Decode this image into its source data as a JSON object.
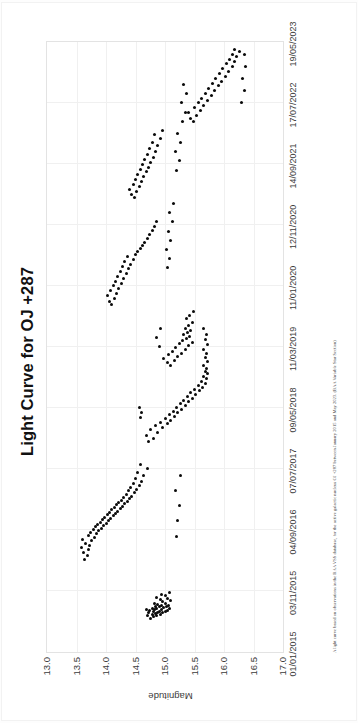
{
  "document": {
    "figure_title": "Light Curve for OJ +287",
    "caption": "A light curve based on observations in the BAA VSS database, for the active galactic nucleus OJ +287 between January 2015 and May 2023. (BAA Variable Star Section)"
  },
  "chart_data": {
    "type": "scatter",
    "title": "Light Curve for OJ +287",
    "xlabel": "",
    "ylabel": "Magnitude",
    "grid": true,
    "legend": "none",
    "y_inverted": true,
    "ylim": [
      13.0,
      17.0
    ],
    "y_ticks": [
      "13.0",
      "13.5",
      "14.0",
      "14.5",
      "15.0",
      "15.5",
      "16.0",
      "16.5",
      "17.0"
    ],
    "x_ticks": [
      "01/01/2015",
      "03/11/2015",
      "04/09/2016",
      "07/07/2017",
      "09/05/2018",
      "11/03/2019",
      "11/01/2020",
      "12/11/2020",
      "14/09/2021",
      "17/07/2022",
      "19/05/2023"
    ],
    "xlim": [
      "01/01/2015",
      "19/05/2023"
    ],
    "series": [
      {
        "name": "OJ +287 visual magnitude",
        "marker": "filled-circle",
        "color": "#0a0a0a",
        "points": [
          [
            0.055,
            14.76
          ],
          [
            0.058,
            14.8
          ],
          [
            0.06,
            14.86
          ],
          [
            0.06,
            14.7
          ],
          [
            0.062,
            14.92
          ],
          [
            0.062,
            14.78
          ],
          [
            0.063,
            14.84
          ],
          [
            0.064,
            14.96
          ],
          [
            0.064,
            14.72
          ],
          [
            0.065,
            14.88
          ],
          [
            0.066,
            15.0
          ],
          [
            0.066,
            14.8
          ],
          [
            0.067,
            14.9
          ],
          [
            0.068,
            14.74
          ],
          [
            0.068,
            15.04
          ],
          [
            0.069,
            14.82
          ],
          [
            0.07,
            14.94
          ],
          [
            0.07,
            14.68
          ],
          [
            0.071,
            14.86
          ],
          [
            0.072,
            15.08
          ],
          [
            0.072,
            14.78
          ],
          [
            0.073,
            14.98
          ],
          [
            0.074,
            14.84
          ],
          [
            0.074,
            15.02
          ],
          [
            0.075,
            14.9
          ],
          [
            0.076,
            14.94
          ],
          [
            0.077,
            15.06
          ],
          [
            0.078,
            14.88
          ],
          [
            0.079,
            15.0
          ],
          [
            0.08,
            14.82
          ],
          [
            0.082,
            14.96
          ],
          [
            0.084,
            15.1
          ],
          [
            0.086,
            14.92
          ],
          [
            0.088,
            15.04
          ],
          [
            0.09,
            14.86
          ],
          [
            0.092,
            15.0
          ],
          [
            0.095,
            14.94
          ],
          [
            0.098,
            15.08
          ],
          [
            0.152,
            13.64
          ],
          [
            0.158,
            13.68
          ],
          [
            0.163,
            13.62
          ],
          [
            0.168,
            13.7
          ],
          [
            0.171,
            13.58
          ],
          [
            0.175,
            13.72
          ],
          [
            0.178,
            13.66
          ],
          [
            0.182,
            13.76
          ],
          [
            0.185,
            13.6
          ],
          [
            0.188,
            13.8
          ],
          [
            0.191,
            13.7
          ],
          [
            0.194,
            13.84
          ],
          [
            0.196,
            13.74
          ],
          [
            0.199,
            13.88
          ],
          [
            0.201,
            13.78
          ],
          [
            0.203,
            13.92
          ],
          [
            0.205,
            13.82
          ],
          [
            0.207,
            13.96
          ],
          [
            0.209,
            13.86
          ],
          [
            0.211,
            14.0
          ],
          [
            0.213,
            13.9
          ],
          [
            0.215,
            14.04
          ],
          [
            0.217,
            13.94
          ],
          [
            0.219,
            14.08
          ],
          [
            0.221,
            13.98
          ],
          [
            0.223,
            14.12
          ],
          [
            0.225,
            14.02
          ],
          [
            0.227,
            14.16
          ],
          [
            0.229,
            14.06
          ],
          [
            0.231,
            14.2
          ],
          [
            0.233,
            14.1
          ],
          [
            0.235,
            14.24
          ],
          [
            0.237,
            14.14
          ],
          [
            0.239,
            14.28
          ],
          [
            0.241,
            14.18
          ],
          [
            0.243,
            14.32
          ],
          [
            0.245,
            14.22
          ],
          [
            0.247,
            14.36
          ],
          [
            0.249,
            14.26
          ],
          [
            0.251,
            14.4
          ],
          [
            0.253,
            14.3
          ],
          [
            0.255,
            14.44
          ],
          [
            0.258,
            14.34
          ],
          [
            0.261,
            14.48
          ],
          [
            0.264,
            14.38
          ],
          [
            0.267,
            14.52
          ],
          [
            0.27,
            14.42
          ],
          [
            0.273,
            14.56
          ],
          [
            0.276,
            14.46
          ],
          [
            0.28,
            14.6
          ],
          [
            0.284,
            14.5
          ],
          [
            0.289,
            14.64
          ],
          [
            0.294,
            14.54
          ],
          [
            0.3,
            14.7
          ],
          [
            0.307,
            14.58
          ],
          [
            0.19,
            15.2
          ],
          [
            0.215,
            15.22
          ],
          [
            0.24,
            15.24
          ],
          [
            0.265,
            15.18
          ],
          [
            0.29,
            15.26
          ],
          [
            0.345,
            14.72
          ],
          [
            0.35,
            14.8
          ],
          [
            0.355,
            14.68
          ],
          [
            0.36,
            14.88
          ],
          [
            0.364,
            14.76
          ],
          [
            0.368,
            14.96
          ],
          [
            0.371,
            14.84
          ],
          [
            0.374,
            15.04
          ],
          [
            0.377,
            14.92
          ],
          [
            0.38,
            15.1
          ],
          [
            0.383,
            15.0
          ],
          [
            0.386,
            15.16
          ],
          [
            0.389,
            15.08
          ],
          [
            0.392,
            15.22
          ],
          [
            0.395,
            15.14
          ],
          [
            0.398,
            15.28
          ],
          [
            0.401,
            15.2
          ],
          [
            0.404,
            15.34
          ],
          [
            0.407,
            15.26
          ],
          [
            0.41,
            15.4
          ],
          [
            0.413,
            15.32
          ],
          [
            0.416,
            15.46
          ],
          [
            0.419,
            15.38
          ],
          [
            0.422,
            15.52
          ],
          [
            0.425,
            15.44
          ],
          [
            0.428,
            15.58
          ],
          [
            0.431,
            15.5
          ],
          [
            0.434,
            15.64
          ],
          [
            0.437,
            15.56
          ],
          [
            0.44,
            15.68
          ],
          [
            0.444,
            15.62
          ],
          [
            0.448,
            15.7
          ],
          [
            0.452,
            15.66
          ],
          [
            0.456,
            15.72
          ],
          [
            0.46,
            15.68
          ],
          [
            0.465,
            15.7
          ],
          [
            0.47,
            15.66
          ],
          [
            0.476,
            15.72
          ],
          [
            0.482,
            15.68
          ],
          [
            0.489,
            15.7
          ],
          [
            0.496,
            15.66
          ],
          [
            0.504,
            15.72
          ],
          [
            0.512,
            15.68
          ],
          [
            0.521,
            15.7
          ],
          [
            0.53,
            15.66
          ],
          [
            0.385,
            14.58
          ],
          [
            0.392,
            14.6
          ],
          [
            0.4,
            14.56
          ],
          [
            0.47,
            15.1
          ],
          [
            0.474,
            15.04
          ],
          [
            0.478,
            15.16
          ],
          [
            0.481,
            14.98
          ],
          [
            0.484,
            15.22
          ],
          [
            0.487,
            15.06
          ],
          [
            0.49,
            15.28
          ],
          [
            0.493,
            15.12
          ],
          [
            0.496,
            15.34
          ],
          [
            0.499,
            15.18
          ],
          [
            0.502,
            15.4
          ],
          [
            0.505,
            15.24
          ],
          [
            0.508,
            15.46
          ],
          [
            0.511,
            15.3
          ],
          [
            0.514,
            15.36
          ],
          [
            0.517,
            15.42
          ],
          [
            0.52,
            15.32
          ],
          [
            0.523,
            15.38
          ],
          [
            0.527,
            15.44
          ],
          [
            0.531,
            15.34
          ],
          [
            0.535,
            15.4
          ],
          [
            0.54,
            15.46
          ],
          [
            0.546,
            15.36
          ],
          [
            0.552,
            15.42
          ],
          [
            0.559,
            15.48
          ],
          [
            0.5,
            14.9
          ],
          [
            0.515,
            14.86
          ],
          [
            0.53,
            14.92
          ],
          [
            0.57,
            14.1
          ],
          [
            0.575,
            14.06
          ],
          [
            0.58,
            14.14
          ],
          [
            0.584,
            14.02
          ],
          [
            0.588,
            14.18
          ],
          [
            0.592,
            14.08
          ],
          [
            0.596,
            14.22
          ],
          [
            0.6,
            14.12
          ],
          [
            0.604,
            14.26
          ],
          [
            0.608,
            14.16
          ],
          [
            0.612,
            14.3
          ],
          [
            0.616,
            14.2
          ],
          [
            0.62,
            14.34
          ],
          [
            0.624,
            14.24
          ],
          [
            0.628,
            14.38
          ],
          [
            0.632,
            14.28
          ],
          [
            0.636,
            14.42
          ],
          [
            0.64,
            14.32
          ],
          [
            0.644,
            14.46
          ],
          [
            0.648,
            14.36
          ],
          [
            0.652,
            14.5
          ],
          [
            0.657,
            14.54
          ],
          [
            0.662,
            14.58
          ],
          [
            0.667,
            14.62
          ],
          [
            0.672,
            14.66
          ],
          [
            0.678,
            14.7
          ],
          [
            0.684,
            14.74
          ],
          [
            0.691,
            14.78
          ],
          [
            0.698,
            14.82
          ],
          [
            0.706,
            14.86
          ],
          [
            0.63,
            15.04
          ],
          [
            0.645,
            15.08
          ],
          [
            0.66,
            15.02
          ],
          [
            0.675,
            15.1
          ],
          [
            0.69,
            15.06
          ],
          [
            0.705,
            15.12
          ],
          [
            0.72,
            15.08
          ],
          [
            0.735,
            15.14
          ],
          [
            0.745,
            14.48
          ],
          [
            0.75,
            14.44
          ],
          [
            0.755,
            14.52
          ],
          [
            0.759,
            14.4
          ],
          [
            0.763,
            14.56
          ],
          [
            0.767,
            14.46
          ],
          [
            0.771,
            14.6
          ],
          [
            0.775,
            14.5
          ],
          [
            0.779,
            14.64
          ],
          [
            0.783,
            14.54
          ],
          [
            0.787,
            14.68
          ],
          [
            0.791,
            14.58
          ],
          [
            0.795,
            14.72
          ],
          [
            0.799,
            14.62
          ],
          [
            0.803,
            14.76
          ],
          [
            0.807,
            14.66
          ],
          [
            0.811,
            14.8
          ],
          [
            0.815,
            14.7
          ],
          [
            0.82,
            14.84
          ],
          [
            0.825,
            14.74
          ],
          [
            0.83,
            14.88
          ],
          [
            0.836,
            14.78
          ],
          [
            0.842,
            14.92
          ],
          [
            0.848,
            14.82
          ],
          [
            0.855,
            14.96
          ],
          [
            0.79,
            15.2
          ],
          [
            0.805,
            15.24
          ],
          [
            0.82,
            15.18
          ],
          [
            0.835,
            15.26
          ],
          [
            0.85,
            15.22
          ],
          [
            0.87,
            15.48
          ],
          [
            0.875,
            15.44
          ],
          [
            0.88,
            15.54
          ],
          [
            0.884,
            15.4
          ],
          [
            0.888,
            15.6
          ],
          [
            0.892,
            15.5
          ],
          [
            0.896,
            15.66
          ],
          [
            0.9,
            15.56
          ],
          [
            0.904,
            15.72
          ],
          [
            0.908,
            15.62
          ],
          [
            0.912,
            15.78
          ],
          [
            0.916,
            15.68
          ],
          [
            0.92,
            15.84
          ],
          [
            0.924,
            15.74
          ],
          [
            0.928,
            15.9
          ],
          [
            0.932,
            15.8
          ],
          [
            0.936,
            15.96
          ],
          [
            0.94,
            15.86
          ],
          [
            0.944,
            16.02
          ],
          [
            0.948,
            15.92
          ],
          [
            0.952,
            16.08
          ],
          [
            0.956,
            15.98
          ],
          [
            0.96,
            16.14
          ],
          [
            0.964,
            16.04
          ],
          [
            0.968,
            16.18
          ],
          [
            0.972,
            16.1
          ],
          [
            0.976,
            16.22
          ],
          [
            0.98,
            16.14
          ],
          [
            0.984,
            16.26
          ],
          [
            0.988,
            16.18
          ],
          [
            0.9,
            16.3
          ],
          [
            0.92,
            16.34
          ],
          [
            0.94,
            16.32
          ],
          [
            0.96,
            16.36
          ],
          [
            0.98,
            16.34
          ],
          [
            0.87,
            15.3
          ],
          [
            0.885,
            15.34
          ],
          [
            0.9,
            15.28
          ],
          [
            0.915,
            15.36
          ],
          [
            0.93,
            15.32
          ]
        ]
      }
    ]
  }
}
